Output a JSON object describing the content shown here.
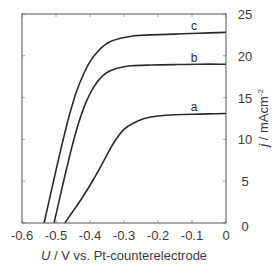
{
  "chart_data": {
    "type": "line",
    "title": "",
    "xlabel": "U / V vs. Pt-counterelectrode",
    "xlabel_parts": {
      "var": "U",
      "rest": " / V vs. Pt-counterelectrode"
    },
    "ylabel": "j / mAcm-2",
    "ylabel_parts": {
      "var": "j",
      "rest": " / mAcm",
      "sup": "-2"
    },
    "xlim": [
      -0.6,
      0
    ],
    "ylim": [
      0,
      25
    ],
    "xticks": [
      -0.6,
      -0.5,
      -0.4,
      -0.3,
      -0.2,
      -0.1,
      0
    ],
    "xtick_labels": [
      "-0.6",
      "-0.5",
      "-0.4",
      "-0.3",
      "-0.2",
      "-0.1",
      "0"
    ],
    "yticks": [
      0,
      5,
      10,
      15,
      20,
      25
    ],
    "ytick_labels": [
      "0",
      "5",
      "10",
      "15",
      "20",
      "25"
    ],
    "yaxis_position": "right",
    "grid": false,
    "legend": "inline curve labels",
    "series": [
      {
        "name": "a",
        "label_at": [
          -0.1,
          13.4
        ],
        "x": [
          -0.474,
          -0.45,
          -0.42,
          -0.39,
          -0.36,
          -0.33,
          -0.3,
          -0.27,
          -0.24,
          -0.2,
          -0.15,
          -0.1,
          -0.05,
          0
        ],
        "y": [
          0,
          1.4,
          3.2,
          5.2,
          7.4,
          9.6,
          11.2,
          12.0,
          12.5,
          12.8,
          12.95,
          13.0,
          13.05,
          13.1
        ]
      },
      {
        "name": "b",
        "label_at": [
          -0.1,
          19.3
        ],
        "x": [
          -0.506,
          -0.49,
          -0.47,
          -0.45,
          -0.43,
          -0.41,
          -0.39,
          -0.37,
          -0.35,
          -0.32,
          -0.28,
          -0.22,
          -0.15,
          -0.08,
          0
        ],
        "y": [
          0,
          2.8,
          6.3,
          9.6,
          12.4,
          14.6,
          16.2,
          17.3,
          18.0,
          18.5,
          18.8,
          18.9,
          18.95,
          19.0,
          19.0
        ]
      },
      {
        "name": "c",
        "label_at": [
          -0.1,
          23.1
        ],
        "x": [
          -0.535,
          -0.52,
          -0.5,
          -0.48,
          -0.46,
          -0.44,
          -0.42,
          -0.4,
          -0.38,
          -0.36,
          -0.34,
          -0.31,
          -0.27,
          -0.22,
          -0.15,
          -0.08,
          0
        ],
        "y": [
          0,
          2.7,
          6.3,
          9.8,
          13.0,
          15.7,
          17.7,
          19.3,
          20.4,
          21.2,
          21.7,
          22.1,
          22.4,
          22.5,
          22.6,
          22.7,
          22.8
        ]
      }
    ]
  }
}
